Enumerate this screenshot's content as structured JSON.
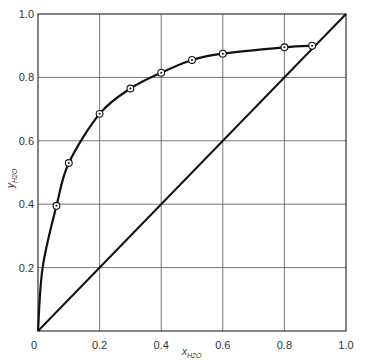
{
  "chart_data": {
    "type": "line",
    "title": "",
    "xlabel": "x_H2O",
    "ylabel": "y_H2O",
    "xlabel_main": "x",
    "ylabel_main": "y",
    "label_subscript": "H2O",
    "xlim": [
      0,
      1.0
    ],
    "ylim": [
      0,
      1.0
    ],
    "grid": true,
    "legend": null,
    "x_ticks": [
      "0",
      "0.2",
      "0.4",
      "0.6",
      "0.8",
      "1.0"
    ],
    "y_ticks": [
      "0.2",
      "0.4",
      "0.6",
      "0.8",
      "1.0"
    ],
    "x_tick_values": [
      0,
      0.2,
      0.4,
      0.6,
      0.8,
      1.0
    ],
    "y_tick_values": [
      0.2,
      0.4,
      0.6,
      0.8,
      1.0
    ],
    "series": [
      {
        "name": "equilibrium curve (data points)",
        "marker": "circle-dot",
        "x": [
          0.06,
          0.1,
          0.2,
          0.3,
          0.4,
          0.5,
          0.6,
          0.8,
          0.89
        ],
        "y": [
          0.395,
          0.53,
          0.685,
          0.765,
          0.815,
          0.855,
          0.875,
          0.895,
          0.9
        ]
      },
      {
        "name": "y = x diagonal",
        "x": [
          0,
          1.0
        ],
        "y": [
          0,
          1.0
        ]
      }
    ],
    "colors": {
      "line": "#111111",
      "grid": "#555555",
      "background": "#ffffff"
    }
  }
}
